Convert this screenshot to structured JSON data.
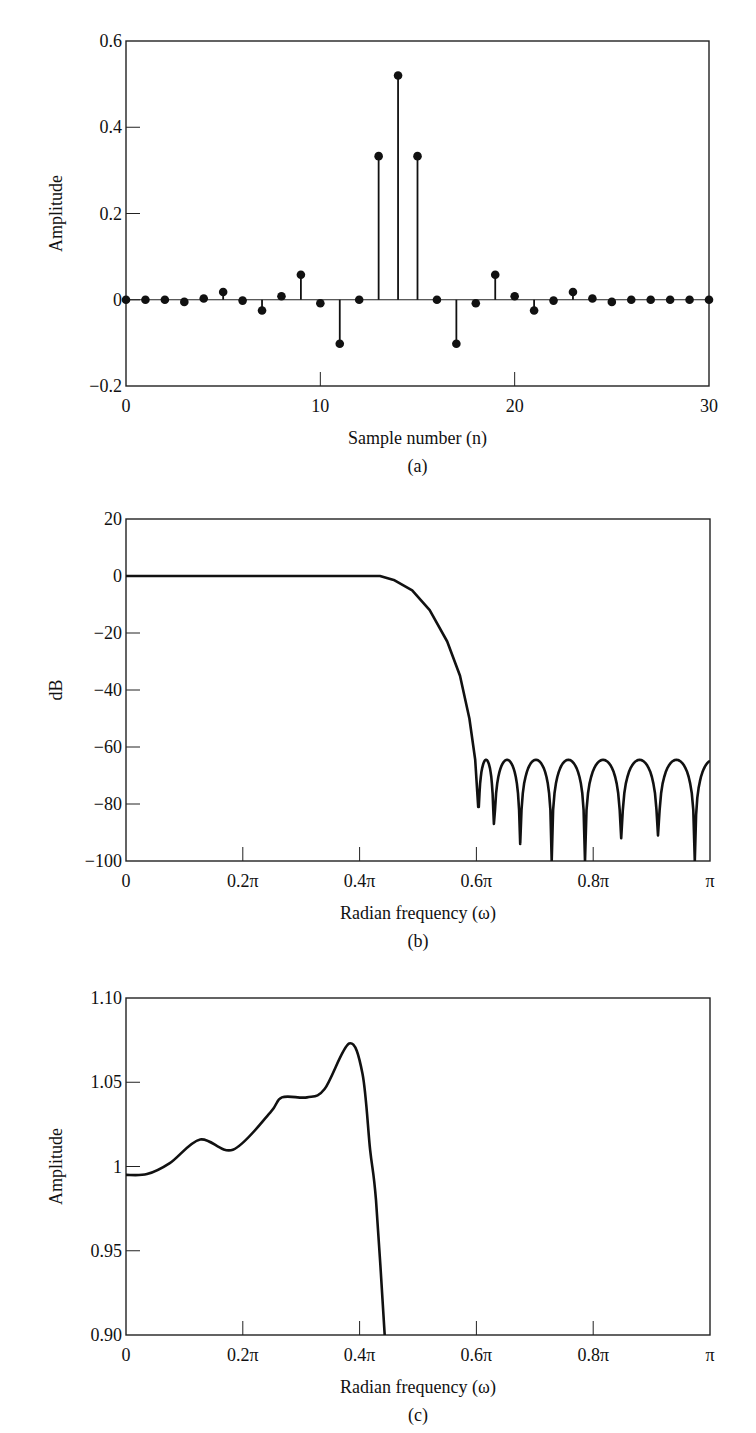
{
  "chart_data": [
    {
      "panel": "a",
      "type": "stem",
      "caption": "(a)",
      "xlabel": "Sample number (n)",
      "ylabel": "Amplitude",
      "xlim": [
        0,
        30
      ],
      "ylim": [
        -0.2,
        0.6
      ],
      "xticks": [
        0,
        10,
        20,
        30
      ],
      "yticks": [
        -0.2,
        0,
        0.2,
        0.4,
        0.6
      ],
      "ytick_labels": [
        "−0.2",
        "0",
        "0.2",
        "0.4",
        "0.6"
      ],
      "grid": false,
      "x": [
        0,
        1,
        2,
        3,
        4,
        5,
        6,
        7,
        8,
        9,
        10,
        11,
        12,
        13,
        14,
        15,
        16,
        17,
        18,
        19,
        20,
        21,
        22,
        23,
        24,
        25,
        26,
        27,
        28,
        29,
        30
      ],
      "values": [
        0,
        0,
        0,
        -0.005,
        0.003,
        0.018,
        -0.002,
        -0.025,
        0.008,
        0.058,
        -0.008,
        -0.102,
        0,
        0.333,
        0.52,
        0.333,
        0,
        -0.102,
        -0.008,
        0.058,
        0.008,
        -0.025,
        -0.002,
        0.018,
        0.003,
        -0.005,
        0,
        0,
        0,
        0,
        0
      ]
    },
    {
      "panel": "b",
      "type": "line",
      "caption": "(b)",
      "xlabel": "Radian frequency (ω)",
      "ylabel": "dB",
      "xlim": [
        0,
        1
      ],
      "x_unit": "pi",
      "ylim": [
        -100,
        20
      ],
      "xticks": [
        0,
        0.2,
        0.4,
        0.6,
        0.8,
        1.0
      ],
      "xtick_labels": [
        "0",
        "0.2π",
        "0.4π",
        "0.6π",
        "0.8π",
        "π"
      ],
      "yticks": [
        -100,
        -80,
        -60,
        -40,
        -20,
        0,
        20
      ],
      "ytick_labels": [
        "−100",
        "−80",
        "−60",
        "−40",
        "−20",
        "0",
        "20"
      ],
      "grid": false,
      "passband": {
        "x": [
          0,
          0.435,
          0.46,
          0.49,
          0.52,
          0.55,
          0.572,
          0.588,
          0.598
        ],
        "y": [
          0,
          0,
          -1.5,
          -5,
          -12,
          -23,
          -35,
          -50,
          -64.5
        ]
      },
      "stopband_nulls": {
        "x": [
          0.603,
          0.63,
          0.675,
          0.729,
          0.786,
          0.848,
          0.911,
          0.974
        ],
        "y": [
          -81,
          -87,
          -94,
          -100,
          -100,
          -92,
          -91,
          -100
        ]
      },
      "stopband_peak_level": -64.5
    },
    {
      "panel": "c",
      "type": "line",
      "caption": "(c)",
      "xlabel": "Radian frequency (ω)",
      "ylabel": "Amplitude",
      "xlim": [
        0,
        1
      ],
      "x_unit": "pi",
      "ylim": [
        0.9,
        1.1
      ],
      "xticks": [
        0,
        0.2,
        0.4,
        0.6,
        0.8,
        1.0
      ],
      "xtick_labels": [
        "0",
        "0.2π",
        "0.4π",
        "0.6π",
        "0.8π",
        "π"
      ],
      "yticks": [
        0.9,
        0.95,
        1.0,
        1.05,
        1.1
      ],
      "ytick_labels": [
        "0.90",
        "0.95",
        "1",
        "1.05",
        "1.10"
      ],
      "grid": false,
      "x": [
        0,
        0.036,
        0.075,
        0.127,
        0.183,
        0.247,
        0.267,
        0.31,
        0.34,
        0.382,
        0.405,
        0.418,
        0.428,
        0.443
      ],
      "y": [
        0.995,
        0.9955,
        1.002,
        1.016,
        1.01,
        1.032,
        1.041,
        1.041,
        1.046,
        1.073,
        1.055,
        1.01,
        0.98,
        0.9
      ]
    }
  ]
}
